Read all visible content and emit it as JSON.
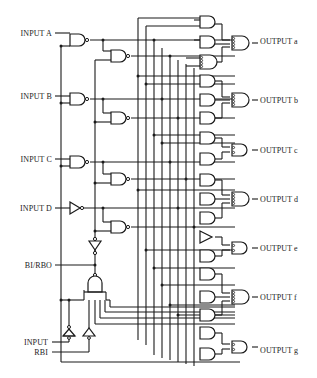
{
  "inputs": {
    "a": "INPUT A",
    "b": "INPUT B",
    "c": "INPUT C",
    "d": "INPUT D",
    "bi_rbo": "BI/RBO",
    "input_line1": "INPUT",
    "input_line2": "RBI"
  },
  "outputs": {
    "a": "OUTPUT a",
    "b": "OUTPUT b",
    "c": "OUTPUT c",
    "d": "OUTPUT d",
    "e": "OUTPUT e",
    "f": "OUTPUT f",
    "g": "OUTPUT g"
  },
  "colors": {
    "line": "#1a1a1a",
    "background": "#ffffff"
  }
}
